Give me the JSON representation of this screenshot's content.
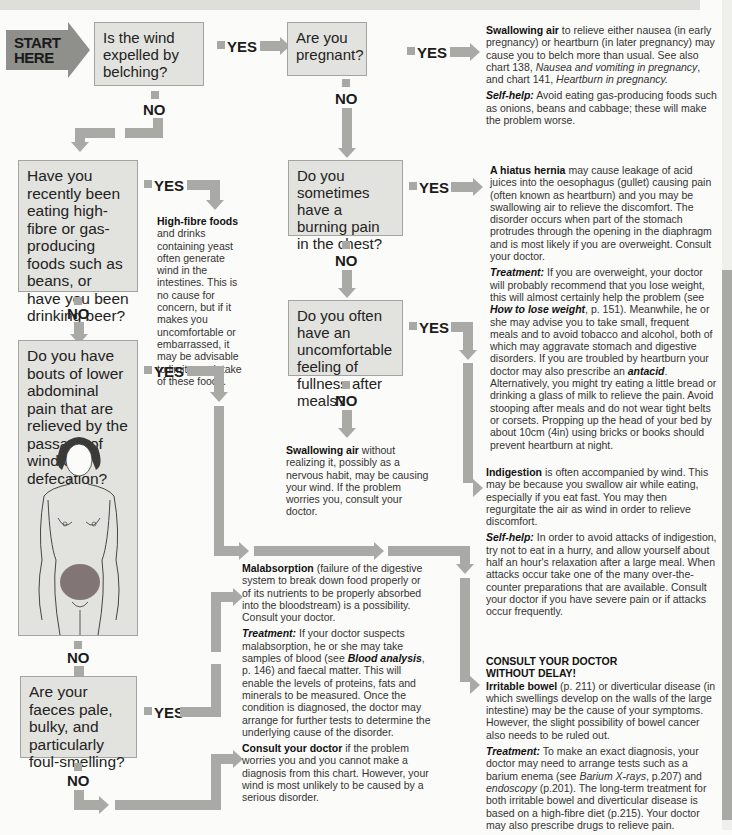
{
  "start": {
    "line1": "START",
    "line2": "HERE"
  },
  "labels": {
    "yes": "YES",
    "no": "NO"
  },
  "questions": [
    {
      "id": "q1",
      "text": "Is the wind expelled by belching?"
    },
    {
      "id": "q2",
      "text": "Are you pregnant?"
    },
    {
      "id": "q3",
      "text": "Have you recently been eating high-fibre or gas-producing foods such as beans, or have you been drinking beer?"
    },
    {
      "id": "q4",
      "text": "Do you sometimes have a burning pain in the chest?"
    },
    {
      "id": "q5",
      "text": "Do you often have an uncomfortable feeling of fullness after meals?"
    },
    {
      "id": "q6",
      "text": "Do you have bouts of lower abdominal pain that are relieved by the passage of wind or defecation?"
    },
    {
      "id": "q7",
      "text": "Are your faeces pale, bulky, and particularly foul-smelling?"
    }
  ],
  "outcomes": {
    "pregnancy": {
      "title": "Swallowing air",
      "body": " to relieve either nausea (in early pregnancy) or heartburn (in later pregnancy) may cause you to belch more than usual. See also chart 138, ",
      "ref1": "Nausea and vomiting in pregnancy",
      "mid": ", and chart 141, ",
      "ref2": "Heartburn in pregnancy.",
      "selfhelp_label": "Self-help:",
      "selfhelp": " Avoid eating gas-producing foods such as onions, beans and cabbage; these will make the problem worse."
    },
    "highfibre": {
      "title": "High-fibre foods",
      "body": " and drinks containing yeast often generate wind in the intestines. This is no cause for concern, but if it makes you uncomfortable or embarrassed, it may be advisable to limit your intake of these foods."
    },
    "hiatus": {
      "title": "A hiatus hernia",
      "body": " may cause leakage of acid juices into the oesophagus (gullet) causing pain (often known as heartburn) and you may be swallowing air to relieve the discomfort. The disorder occurs when part of the stomach protrudes through the opening in the diaphragm and is most likely if you are overweight. Consult your doctor.",
      "treatment_label": "Treatment:",
      "treatment1": " If you are overweight, your doctor will probably recommend that you lose weight, this will almost certainly help the problem (see ",
      "ref1": "How to lose weight",
      "treatment2": ", p. 151). Meanwhile, he or she may advise you to take small, frequent meals and to avoid tobacco and alcohol, both of which may aggravate stomach and digestive disorders. If you are troubled by heartburn your doctor may also prescribe an ",
      "ref2": "antacid",
      "treatment3": ". Alternatively, you might try eating a little bread or drinking a glass of milk to relieve the pain. Avoid stooping after meals and do not wear tight belts or corsets. Propping up the head of your bed by about 10cm (4in) using bricks or books should prevent heartburn at night."
    },
    "swallowing": {
      "title": "Swallowing air",
      "body": " without realizing it, possibly as a nervous habit, may be causing your wind. If the problem worries you, consult your doctor."
    },
    "indigestion": {
      "title": "Indigestion",
      "body": " is often accompanied by wind. This may be because you swallow air while eating, especially if you eat fast. You may then regurgitate the air as wind in order to relieve discomfort.",
      "selfhelp_label": "Self-help:",
      "selfhelp": " In order to avoid attacks of indigestion, try not to eat in a hurry, and allow yourself about half an hour's relaxation after a large meal. When attacks occur take one of the many over-the-counter preparations that are available. Consult your doctor if you have severe pain or if attacks occur frequently."
    },
    "malabsorption": {
      "title": "Malabsorption",
      "body": " (failure of the digestive system to break down food properly or of its nutrients to be properly absorbed into the bloodstream) is a possibility. Consult your doctor.",
      "treatment_label": "Treatment:",
      "treatment1": " If your doctor suspects malabsorption, he or she may take samples of blood (see ",
      "ref1": "Blood analysis",
      "treatment2": ", p. 146) and faecal matter. This will enable the levels of proteins, fats and minerals to be measured. Once the condition is diagnosed, the doctor may arrange for further tests to determine the underlying cause of the disorder."
    },
    "consult": {
      "title": "Consult your doctor",
      "body": " if the problem worries you and you cannot make a diagnosis from this chart. However, your wind is most unlikely to be caused by a serious disorder."
    },
    "urgent": {
      "heading1": "CONSULT YOUR DOCTOR",
      "heading2": "WITHOUT DELAY!",
      "title": "Irritable bowel",
      "body": " (p. 211) or diverticular disease (in which swellings develop on the walls of the large intestine) may be the cause of your symptoms. However, the slight possibility of bowel cancer also needs to be ruled out.",
      "treatment_label": "Treatment:",
      "treatment1": " To make an exact diagnosis, your doctor may need to arrange tests such as a barium enema (see ",
      "ref1": "Barium X-rays",
      "treatment2": ", p.207) and ",
      "ref2": "endoscopy",
      "treatment3": " (p.201). The long-term treatment for both irritable bowel and diverticular disease is based on a high-fibre diet (p.215). Your doctor may also prescribe drugs to relieve pain."
    }
  },
  "colors": {
    "box": "#e2e2df",
    "arrow": "#a9a9a6",
    "start": "#8f8f8c",
    "text": "#333333"
  }
}
